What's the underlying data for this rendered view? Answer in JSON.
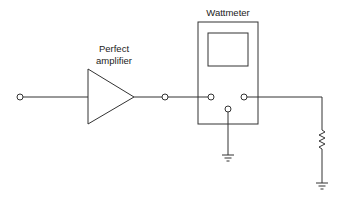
{
  "diagram": {
    "type": "circuit-schematic",
    "components": {
      "input_terminal": {
        "label": ""
      },
      "amplifier": {
        "label_line1": "Perfect",
        "label_line2": "amplifier",
        "symbol": "triangle-buffer"
      },
      "output_terminal": {
        "label": ""
      },
      "wattmeter": {
        "label": "Wattmeter",
        "terminals": [
          "left",
          "right",
          "bottom"
        ]
      },
      "meter_ground": {
        "symbol": "ground-icon"
      },
      "load_resistor": {
        "symbol": "resistor-icon"
      },
      "load_ground": {
        "symbol": "ground-icon"
      }
    },
    "connections": [
      "input_terminal -> amplifier",
      "amplifier -> output_terminal",
      "output_terminal -> wattmeter.left",
      "wattmeter.bottom -> meter_ground",
      "wattmeter.right -> load_resistor",
      "load_resistor -> load_ground"
    ]
  }
}
